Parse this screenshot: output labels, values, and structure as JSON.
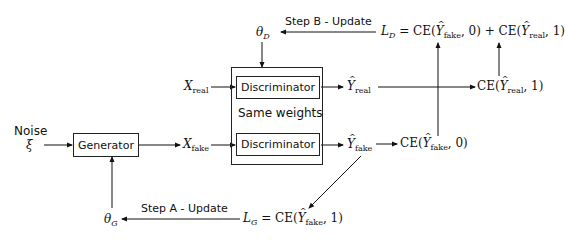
{
  "diagram": {
    "nodes": {
      "noise_label": "Noise",
      "noise_symbol": "ξ",
      "generator": "Generator",
      "discriminator_top": "Discriminator",
      "discriminator_bottom": "Discriminator",
      "same_weights": "Same weights",
      "x_real": "X",
      "x_real_sub": "real",
      "x_fake": "X",
      "x_fake_sub": "fake",
      "y_real": "Y",
      "y_real_sub": "real",
      "y_fake": "Y",
      "y_fake_sub": "fake",
      "theta_d": "θ",
      "theta_d_sub": "D",
      "theta_g": "θ",
      "theta_g_sub": "G",
      "ce_real_1": "CE(Ŷreal, 1)",
      "ce_fake_0": "CE(Ŷfake, 0)",
      "loss_d": "LD = CE(Ŷfake, 0) + CE(Ŷreal, 1)",
      "loss_g": "LG = CE(Ŷfake, 1)"
    },
    "math_parts": {
      "ce": "CE(",
      "comma0": ", 0)",
      "comma1": ", 1)",
      "plus": " + ",
      "eq": " = ",
      "L": "L",
      "D": "D",
      "G": "G",
      "Y": "Y",
      "real": "real",
      "fake": "fake"
    },
    "edges": {
      "step_b": "Step B - Update",
      "step_a": "Step A - Update"
    }
  }
}
